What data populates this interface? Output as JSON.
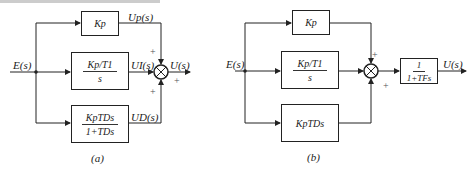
{
  "diagram_a": {
    "caption": "(a)",
    "input": "E(s)",
    "output": "U(s)",
    "blocks": {
      "proportional": "Kp",
      "integral_num": "Kp/T1",
      "integral_den": "s",
      "derivative_num": "KpTDs",
      "derivative_den": "1+TDs"
    },
    "signals": {
      "up": "Up(s)",
      "ui": "UI(s)",
      "ud": "UD(s)"
    },
    "signs": [
      "+",
      "+",
      "+"
    ]
  },
  "diagram_b": {
    "caption": "(b)",
    "input": "E(s)",
    "output": "U(s)",
    "blocks": {
      "proportional": "Kp",
      "integral_num": "Kp/T1",
      "integral_den": "s",
      "derivative": "KpTDs",
      "filter_num": "1",
      "filter_den": "1+TFs"
    },
    "signs": [
      "+",
      "+"
    ]
  }
}
